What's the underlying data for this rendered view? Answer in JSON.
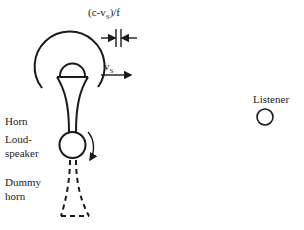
{
  "diagram": {
    "type": "physics-illustration",
    "title": "",
    "spacing_label": {
      "prefix": "(c-v",
      "subscript": "S",
      "suffix": ")/f"
    },
    "velocity_label": {
      "main": "v",
      "subscript": "S"
    },
    "labels": {
      "horn": "Horn",
      "loudspeaker_line1": "Loud-",
      "loudspeaker_line2": "speaker",
      "dummy_line1": "Dummy",
      "dummy_line2": "horn",
      "listener": "Listener"
    },
    "colors": {
      "stroke": "#1a1a1a",
      "text": "#222222",
      "background": "#ffffff"
    }
  }
}
